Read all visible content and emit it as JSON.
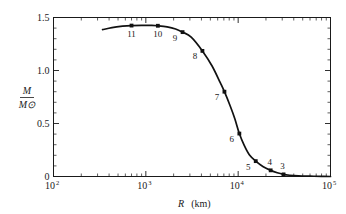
{
  "figure": {
    "name": "white-dwarf-mass-radius-relation",
    "background_color": "#ffffff",
    "ink_color": "#111111"
  },
  "chart_data": {
    "type": "line",
    "title": "",
    "subtitle": "",
    "xlabel": "R (km)",
    "xlabel_symbol": "R",
    "xlabel_unit": "(km)",
    "ylabel": "M/M⊙",
    "ylabel_numerator": "M",
    "ylabel_denominator": "M⊙",
    "xscale": "log",
    "yscale": "linear",
    "xlim": [
      100,
      100000
    ],
    "ylim": [
      0,
      1.5
    ],
    "grid": false,
    "legend": "none",
    "xticks": [
      {
        "value": 100,
        "label": "10",
        "exponent": "2"
      },
      {
        "value": 1000,
        "label": "10",
        "exponent": "3"
      },
      {
        "value": 10000,
        "label": "10",
        "exponent": "4"
      },
      {
        "value": 100000,
        "label": "10",
        "exponent": "5"
      }
    ],
    "yticks": [
      {
        "value": 0,
        "label": "0"
      },
      {
        "value": 0.5,
        "label": "0.5"
      },
      {
        "value": 1.0,
        "label": "1.0"
      },
      {
        "value": 1.5,
        "label": "1.5"
      }
    ],
    "yminor_step": 0.1,
    "xminor": "decade multiples 2-9",
    "series": [
      {
        "name": "mass-radius curve",
        "x": [
          340,
          430,
          560,
          700,
          900,
          1150,
          1350,
          1700,
          2100,
          2500,
          3100,
          4100,
          5200,
          6400,
          7100,
          8200,
          9200,
          10300,
          11600,
          13200,
          15500,
          18500,
          22500,
          26500,
          31000,
          36000,
          45000,
          60000,
          80000,
          100000
        ],
        "y": [
          1.385,
          1.405,
          1.418,
          1.424,
          1.426,
          1.425,
          1.422,
          1.412,
          1.392,
          1.362,
          1.315,
          1.185,
          1.045,
          0.885,
          0.8,
          0.665,
          0.545,
          0.405,
          0.295,
          0.205,
          0.145,
          0.095,
          0.058,
          0.035,
          0.02,
          0.012,
          0.006,
          0.003,
          0.001,
          0.0
        ]
      }
    ],
    "points": [
      {
        "label": "11",
        "x": 700,
        "y": 1.424,
        "label_pos": "below"
      },
      {
        "label": "10",
        "x": 1350,
        "y": 1.422,
        "label_pos": "below"
      },
      {
        "label": "9",
        "x": 2500,
        "y": 1.362,
        "label_pos": "below-left"
      },
      {
        "label": "8",
        "x": 4100,
        "y": 1.185,
        "label_pos": "below-left"
      },
      {
        "label": "7",
        "x": 7100,
        "y": 0.8,
        "label_pos": "below-left"
      },
      {
        "label": "6",
        "x": 10300,
        "y": 0.405,
        "label_pos": "below-left"
      },
      {
        "label": "5",
        "x": 15500,
        "y": 0.145,
        "label_pos": "below-left"
      },
      {
        "label": "4",
        "x": 22500,
        "y": 0.058,
        "label_pos": "above"
      },
      {
        "label": "3",
        "x": 31000,
        "y": 0.02,
        "label_pos": "above"
      }
    ]
  }
}
